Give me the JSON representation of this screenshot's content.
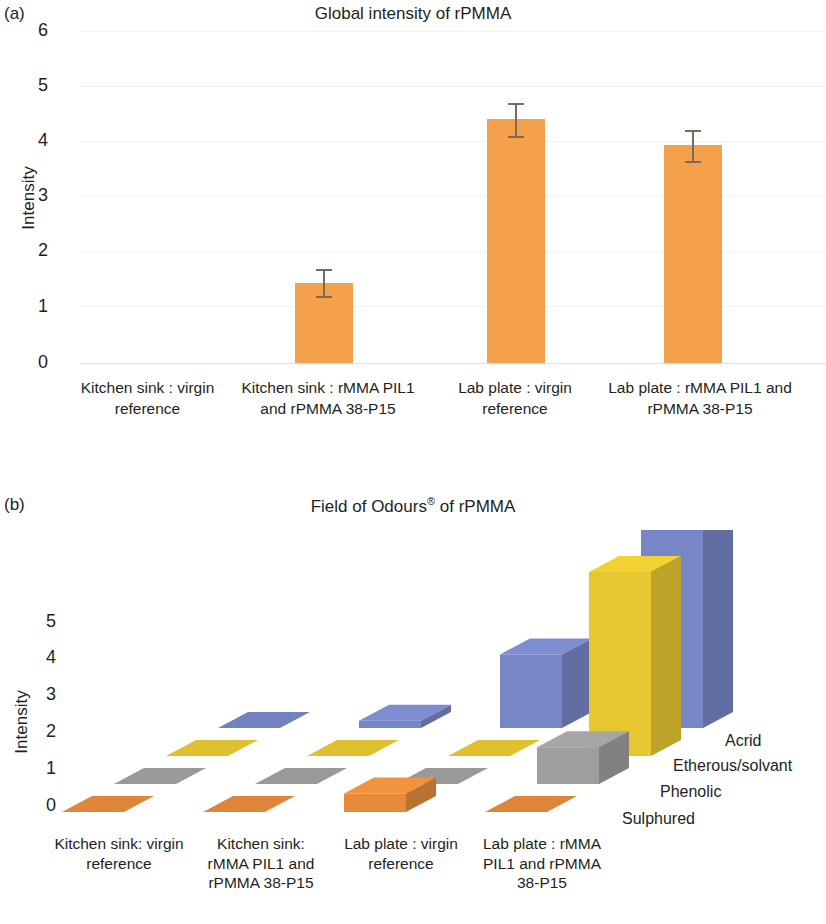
{
  "figure": {
    "panel_a_label": "(a)",
    "panel_b_label": "(b)"
  },
  "panel_a": {
    "title": "Global intensity of rPMMA",
    "ylabel": "Intensity",
    "yticks": [
      "6",
      "5",
      "4",
      "3",
      "2",
      "1",
      "0"
    ],
    "categories": [
      "Kitchen sink : virgin reference",
      "Kitchen sink : rMMA PIL1 and rPMMA 38-P15",
      "Lab plate : virgin reference",
      "Lab plate : rMMA PIL1 and rPMMA 38-P15"
    ],
    "bar_color": "#f5a04a",
    "error_color": "#7a6a5a"
  },
  "panel_b": {
    "title_main": "Field of Odours",
    "title_sup": "®",
    "title_tail": " of rPMMA",
    "title_full": "Field of Odours® of rPMMA",
    "ylabel": "Intensity",
    "yticks": [
      "5",
      "4",
      "3",
      "2",
      "1",
      "0"
    ],
    "categories": [
      "Kitchen sink: virgin reference",
      "Kitchen sink: rMMA PIL1 and rPMMA 38-P15",
      "Lab plate : virgin reference",
      "Lab plate : rMMA PIL1 and rPMMA 38-P15"
    ],
    "series_labels": [
      "Acrid",
      "Etherous/solvant",
      "Phenolic",
      "Sulphured"
    ],
    "series_colors": [
      "#7d8dd0",
      "#f2d132",
      "#a6a6a6",
      "#f0923e"
    ]
  },
  "chart_data": [
    {
      "type": "bar",
      "title": "Global intensity of rPMMA",
      "xlabel": "",
      "ylabel": "Intensity",
      "ylim": [
        0,
        6
      ],
      "grid": true,
      "legend": "none",
      "categories": [
        "Kitchen sink : virgin reference",
        "Kitchen sink : rMMA PIL1 and rPMMA 38-P15",
        "Lab plate : virgin reference",
        "Lab plate : rMMA PIL1 and rPMMA 38-P15"
      ],
      "values": [
        0,
        1.47,
        4.44,
        3.96
      ],
      "errors": [
        0,
        0.25,
        0.3,
        0.3
      ],
      "color": "#f5a04a"
    },
    {
      "type": "bar",
      "title": "Field of Odours® of rPMMA",
      "xlabel": "",
      "ylabel": "Intensity",
      "ylim": [
        0,
        5
      ],
      "grid": false,
      "legend": "right",
      "projection": "3d",
      "categories": [
        "Kitchen sink: virgin reference",
        "Kitchen sink: rMMA PIL1 and rPMMA 38-P15",
        "Lab plate : virgin reference",
        "Lab plate : rMMA PIL1 and rPMMA 38-P15"
      ],
      "series": [
        {
          "name": "Acrid",
          "color": "#7d8dd0",
          "values": [
            0,
            0.2,
            2.0,
            5.8
          ]
        },
        {
          "name": "Etherous/solvant",
          "color": "#f2d132",
          "values": [
            0,
            0,
            0,
            5.0
          ]
        },
        {
          "name": "Phenolic",
          "color": "#a6a6a6",
          "values": [
            0,
            0,
            0,
            1.0
          ]
        },
        {
          "name": "Sulphured",
          "color": "#f0923e",
          "values": [
            0,
            0,
            0.5,
            0
          ]
        }
      ]
    }
  ]
}
